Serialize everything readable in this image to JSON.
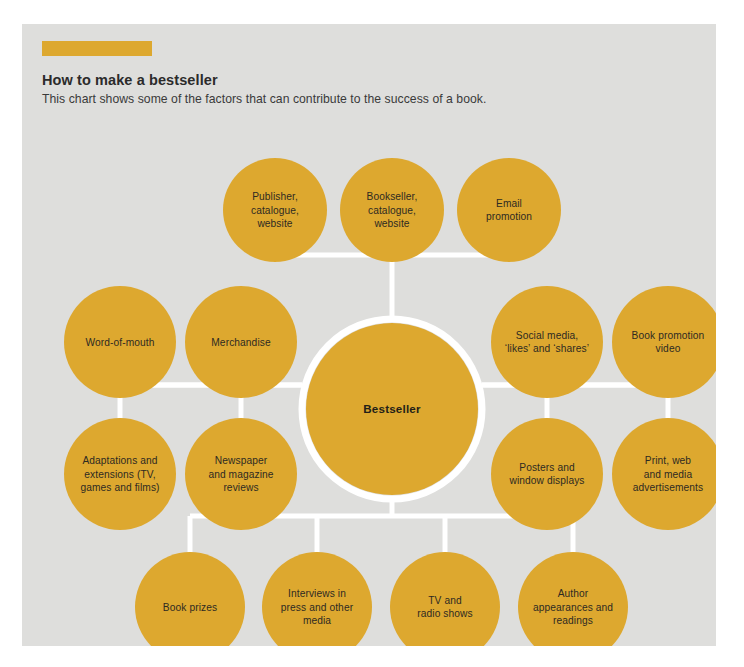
{
  "colors": {
    "accent": "#dda82f",
    "panel_background": "#dededc",
    "connector": "#ffffff",
    "text": "#2b2b2b",
    "page_background": "#ffffff"
  },
  "header": {
    "accent_bar": "",
    "title": "How to make a bestseller",
    "subtitle": "This chart shows some of the factors that can contribute to the success of a book."
  },
  "chart_data": {
    "type": "diagram",
    "title": "How to make a bestseller",
    "subtitle": "This chart shows some of the factors that can contribute to the success of a book.",
    "center": {
      "label": "Bestseller",
      "cx": 370,
      "cy": 385,
      "r": 86
    },
    "groups": [
      {
        "name": "top",
        "orientation": "top",
        "nodes": [
          {
            "id": "publisher-catalogue-website",
            "lines": [
              "Publisher,",
              "catalogue,",
              "website"
            ],
            "cx": 253,
            "cy": 186,
            "r": 52
          },
          {
            "id": "bookseller-catalogue-website",
            "lines": [
              "Bookseller,",
              "catalogue,",
              "website"
            ],
            "cx": 370,
            "cy": 186,
            "r": 52
          },
          {
            "id": "email-promotion",
            "lines": [
              "Email",
              "promotion"
            ],
            "cx": 487,
            "cy": 186,
            "r": 52
          }
        ]
      },
      {
        "name": "left-upper",
        "orientation": "left",
        "nodes": [
          {
            "id": "word-of-mouth",
            "lines": [
              "Word-of-mouth"
            ],
            "cx": 98,
            "cy": 318,
            "r": 56
          },
          {
            "id": "merchandise",
            "lines": [
              "Merchandise"
            ],
            "cx": 219,
            "cy": 318,
            "r": 56
          }
        ]
      },
      {
        "name": "left-lower",
        "orientation": "left",
        "nodes": [
          {
            "id": "adaptations-and-extensions",
            "lines": [
              "Adaptations and",
              "extensions (TV,",
              "games and films)"
            ],
            "cx": 98,
            "cy": 450,
            "r": 56
          },
          {
            "id": "newspaper-and-magazine-reviews",
            "lines": [
              "Newspaper",
              "and magazine",
              "reviews"
            ],
            "cx": 219,
            "cy": 450,
            "r": 56
          }
        ]
      },
      {
        "name": "right-upper",
        "orientation": "right",
        "nodes": [
          {
            "id": "social-media-likes-and-shares",
            "lines": [
              "Social media,",
              "‘likes’ and ‘shares’"
            ],
            "cx": 525,
            "cy": 318,
            "r": 56
          },
          {
            "id": "book-promotion-video",
            "lines": [
              "Book promotion",
              "video"
            ],
            "cx": 646,
            "cy": 318,
            "r": 56
          }
        ]
      },
      {
        "name": "right-lower",
        "orientation": "right",
        "nodes": [
          {
            "id": "posters-and-window-displays",
            "lines": [
              "Posters and",
              "window displays"
            ],
            "cx": 525,
            "cy": 450,
            "r": 56
          },
          {
            "id": "print-web-and-media-advertisements",
            "lines": [
              "Print, web",
              "and media",
              "advertisements"
            ],
            "cx": 646,
            "cy": 450,
            "r": 56
          }
        ]
      },
      {
        "name": "bottom",
        "orientation": "bottom",
        "nodes": [
          {
            "id": "book-prizes",
            "lines": [
              "Book prizes"
            ],
            "cx": 168,
            "cy": 583,
            "r": 55
          },
          {
            "id": "interviews-in-press-and-other-media",
            "lines": [
              "Interviews in",
              "press and other",
              "media"
            ],
            "cx": 295,
            "cy": 583,
            "r": 55
          },
          {
            "id": "tv-and-radio-shows",
            "lines": [
              "TV and",
              "radio shows"
            ],
            "cx": 423,
            "cy": 583,
            "r": 55
          },
          {
            "id": "author-appearances-and-readings",
            "lines": [
              "Author",
              "appearances and",
              "readings"
            ],
            "cx": 551,
            "cy": 583,
            "r": 55
          }
        ]
      }
    ],
    "connectors": {
      "top_bar_y": 231,
      "bottom_bar_y": 492,
      "left_bar_y": 361,
      "right_bar_y": 361
    }
  }
}
